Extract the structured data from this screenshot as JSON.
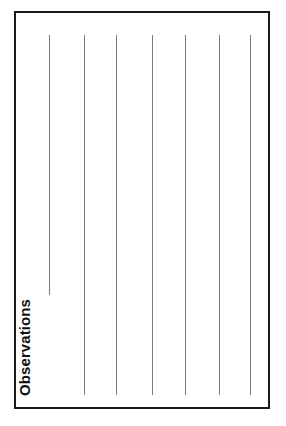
{
  "page": {
    "background_color": "#ffffff",
    "width": 286,
    "height": 426
  },
  "form": {
    "section_label": "Observations",
    "label_orientation": "vertical-bottom-to-top",
    "border_color": "#1a1a1a",
    "border_width_px": 2,
    "box": {
      "left": 14,
      "top": 11,
      "width": 256,
      "height": 398
    }
  },
  "ruling": {
    "line_color": "#7a7a7a",
    "line_width_px": 1,
    "count": 7,
    "lines": [
      {
        "id": "rule-1",
        "x": 33,
        "top": 22,
        "height": 260
      },
      {
        "id": "rule-2",
        "x": 68,
        "top": 22,
        "height": 360
      },
      {
        "id": "rule-3",
        "x": 100,
        "top": 22,
        "height": 360
      },
      {
        "id": "rule-4",
        "x": 136,
        "top": 22,
        "height": 360
      },
      {
        "id": "rule-5",
        "x": 169,
        "top": 22,
        "height": 360
      },
      {
        "id": "rule-6",
        "x": 203,
        "top": 22,
        "height": 360
      },
      {
        "id": "rule-7",
        "x": 234,
        "top": 22,
        "height": 360
      }
    ]
  }
}
